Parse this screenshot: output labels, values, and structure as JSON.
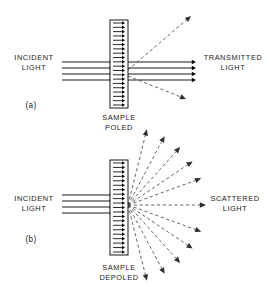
{
  "figure": {
    "width": 280,
    "height": 287,
    "background_color": "#ffffff",
    "line_color": "#000000",
    "dashed_ray_color": "#4a4a4a",
    "text_color": "#1a1a1a"
  },
  "panels": [
    {
      "id": "a",
      "tag": "(a)",
      "tag_position": {
        "x": 31,
        "y": 106
      },
      "left_label": {
        "line1": "INCIDENT",
        "line2": "LIGHT",
        "x": 34,
        "y": 62
      },
      "right_label": {
        "line1": "TRANSMITTED",
        "line2": "LIGHT",
        "x": 233,
        "y": 62
      },
      "caption": {
        "line1": "SAMPLE",
        "line2": "POLED",
        "x": 119,
        "y": 118
      },
      "sample": {
        "x": 110,
        "y": 20,
        "width": 18,
        "height": 88,
        "dipole_count": 20,
        "dipole_direction": "right",
        "state": "poled"
      },
      "incident_rays": {
        "count": 4,
        "x_start": 62,
        "x_end": 114,
        "y_values": [
          62,
          68,
          74,
          80
        ]
      },
      "transmitted_rays": {
        "count": 4,
        "x_start": 128,
        "x_end": 196,
        "y_values": [
          62,
          68,
          74,
          80
        ]
      },
      "scattered_rays": [
        {
          "x1": 128,
          "y1": 70,
          "x2": 191,
          "y2": 16,
          "style": "dashed"
        },
        {
          "x1": 128,
          "y1": 76,
          "x2": 186,
          "y2": 99,
          "style": "dashed"
        }
      ]
    },
    {
      "id": "b",
      "tag": "(b)",
      "tag_position": {
        "x": 31,
        "y": 240
      },
      "left_label": {
        "line1": "INCIDENT",
        "line2": "LIGHT",
        "x": 34,
        "y": 203
      },
      "right_label": {
        "line1": "SCATTERED",
        "line2": "LIGHT",
        "x": 235,
        "y": 203
      },
      "caption": {
        "line1": "SAMPLE",
        "line2": "DEPOLED",
        "x": 119,
        "y": 268
      },
      "sample": {
        "x": 110,
        "y": 160,
        "width": 18,
        "height": 95,
        "dipole_count": 21,
        "dipole_direction": "right",
        "state": "depoled"
      },
      "incident_rays": {
        "count": 4,
        "x_start": 62,
        "x_end": 114,
        "y_values": [
          195,
          201,
          207,
          213
        ]
      },
      "scatter_origin": {
        "x": 128,
        "y": 205
      },
      "scatter_fan": {
        "angles_deg": [
          76,
          62,
          48,
          34,
          20,
          0,
          -20,
          -34,
          -48,
          -62,
          -76
        ],
        "radius": 78,
        "style": "dashed"
      }
    }
  ],
  "chart_data": {
    "type": "diagram",
    "panel_count": 2,
    "panel_labels": [
      "(a)",
      "(b)"
    ],
    "legend_text": [
      "INCIDENT LIGHT",
      "TRANSMITTED LIGHT",
      "SCATTERED LIGHT",
      "SAMPLE POLED",
      "SAMPLE DEPOLED"
    ]
  }
}
